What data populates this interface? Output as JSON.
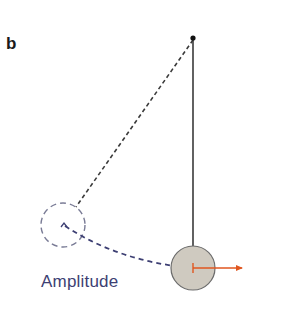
{
  "figure": {
    "panel_label": "b",
    "amplitude_label": "Amplitude",
    "colors": {
      "background": "#ffffff",
      "rod": "#3a3a3a",
      "pivot": "#111111",
      "dashed_line": "#3a3a3a",
      "ghost_circle": "#7a7c96",
      "arc": "#3d3f73",
      "bob_fill": "#cfcac0",
      "bob_stroke": "#6b6b6b",
      "velocity_arrow": "#e0561f",
      "text_accent": "#3d3f73"
    },
    "elements": {
      "pivot": {
        "cx": 193,
        "cy": 38,
        "r": 2.5
      },
      "rod": {
        "x1": 193,
        "y1": 38,
        "x2": 193,
        "y2": 246
      },
      "bob": {
        "cx": 193,
        "cy": 268,
        "r": 22
      },
      "ghost_bob": {
        "cx": 63,
        "cy": 225,
        "r": 22
      },
      "ghost_string": {
        "x1": 193,
        "y1": 40,
        "x2": 76,
        "y2": 207
      },
      "velocity_arrow": {
        "x1": 193,
        "y1": 268,
        "x2": 242,
        "y2": 268
      }
    }
  }
}
